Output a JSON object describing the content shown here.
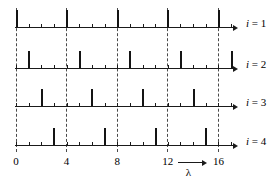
{
  "chart_data": {
    "type": "bar",
    "title": "",
    "subtitle": "",
    "xlabel": "λ",
    "ylabel": "",
    "xlim": [
      -0.4,
      17.6
    ],
    "grid": true,
    "grid_positions": [
      0,
      4,
      8,
      12,
      16
    ],
    "legend_position": "right",
    "x_ticks": [
      0,
      1,
      2,
      3,
      4,
      5,
      6,
      7,
      8,
      9,
      10,
      11,
      12,
      13,
      14,
      15,
      16,
      17
    ],
    "x_tick_labels": [
      {
        "value": 0,
        "label": "0"
      },
      {
        "value": 4,
        "label": "4"
      },
      {
        "value": 8,
        "label": "8"
      },
      {
        "value": 12,
        "label": "12"
      },
      {
        "value": 16,
        "label": "16"
      }
    ],
    "series": [
      {
        "name": "i = 1",
        "row_label_var": "i",
        "row_label_eq": "=",
        "row_label_num": "1",
        "x": [
          0,
          4,
          8,
          12,
          16
        ],
        "values": [
          1,
          1,
          1,
          1,
          1
        ]
      },
      {
        "name": "i = 2",
        "row_label_var": "i",
        "row_label_eq": "=",
        "row_label_num": "2",
        "x": [
          1,
          5,
          9,
          13,
          17
        ],
        "values": [
          1,
          1,
          1,
          1,
          1
        ]
      },
      {
        "name": "i = 3",
        "row_label_var": "i",
        "row_label_eq": "=",
        "row_label_num": "3",
        "x": [
          2,
          6,
          10,
          14
        ],
        "values": [
          1,
          1,
          1,
          1
        ]
      },
      {
        "name": "i = 4",
        "row_label_var": "i",
        "row_label_eq": "=",
        "row_label_num": "4",
        "x": [
          3,
          7,
          11,
          15
        ],
        "values": [
          1,
          1,
          1,
          1
        ]
      }
    ],
    "annotations": [
      {
        "name": "lambda-axis-arrow",
        "text": "λ",
        "x_start": 12.8,
        "x_end": 15.0
      }
    ],
    "colors": {
      "bar": "#141414",
      "axis": "#1a1a1a",
      "grid": "#4a4a4a",
      "background": "#ffffff",
      "text": "#000000"
    }
  }
}
